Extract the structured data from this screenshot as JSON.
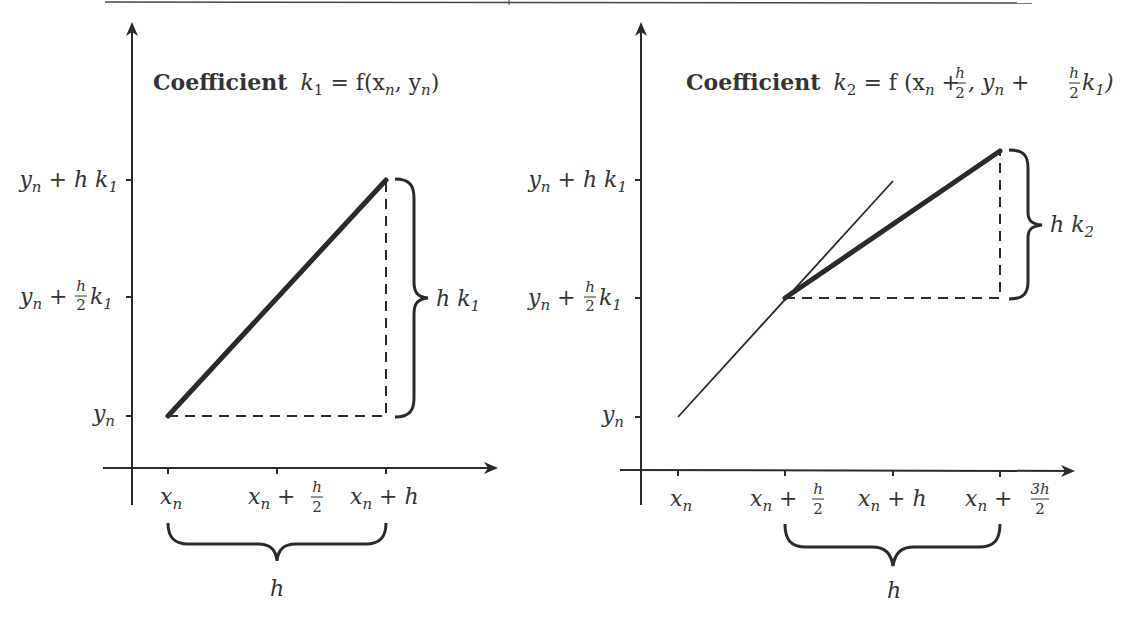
{
  "top_rule": {
    "visible": true
  },
  "panels": [
    {
      "id": "k1",
      "title": {
        "word": "Coefficient",
        "expr_var": "k",
        "expr_sub": "1",
        "expr_rhs": " = f(x",
        "rhs_sub1": "n",
        "rhs_mid": ", y",
        "rhs_sub2": "n",
        "rhs_end": ")"
      },
      "y_ticks": [
        {
          "text": "y",
          "sub": "n",
          "rest": " + h k",
          "rest_sub": "1",
          "pos": "top"
        },
        {
          "text": "y",
          "sub": "n",
          "rest_pre": " + ",
          "frac_num": "h",
          "frac_den": "2",
          "rest": " k",
          "rest_sub": "1",
          "pos": "mid"
        },
        {
          "text": "y",
          "sub": "n",
          "pos": "base"
        }
      ],
      "x_ticks": [
        {
          "text": "x",
          "sub": "n"
        },
        {
          "text": "x",
          "sub": "n",
          "rest_pre": " + ",
          "frac_num": "h",
          "frac_den": "2"
        },
        {
          "text": "x",
          "sub": "n",
          "rest": " + h"
        }
      ],
      "right_brace_label": {
        "text": "h k",
        "sub": "1"
      },
      "bottom_brace_label": "h"
    },
    {
      "id": "k2",
      "title": {
        "word": "Coefficient",
        "expr_var": "k",
        "expr_sub": "2",
        "expr_rhs": " = f (x",
        "rhs_sub1": "n",
        "rhs_plus1": " + ",
        "frac1_num": "h",
        "frac1_den": "2",
        "rhs_mid": ", y",
        "rhs_sub2": "n",
        "rhs_plus2": " + ",
        "frac2_num": "h",
        "frac2_den": "2",
        "rhs_k": " k",
        "rhs_ksub": "1",
        "rhs_end": ")"
      },
      "y_ticks": [
        {
          "text": "y",
          "sub": "n",
          "rest": " + h k",
          "rest_sub": "1",
          "pos": "top"
        },
        {
          "text": "y",
          "sub": "n",
          "rest_pre": " + ",
          "frac_num": "h",
          "frac_den": "2",
          "rest": " k",
          "rest_sub": "1",
          "pos": "mid"
        },
        {
          "text": "y",
          "sub": "n",
          "pos": "base"
        }
      ],
      "x_ticks": [
        {
          "text": "x",
          "sub": "n"
        },
        {
          "text": "x",
          "sub": "n",
          "rest_pre": " + ",
          "frac_num": "h",
          "frac_den": "2"
        },
        {
          "text": "x",
          "sub": "n",
          "rest": " + h"
        },
        {
          "text": "x",
          "sub": "n",
          "rest_pre": " + ",
          "frac_num": "3h",
          "frac_den": "2"
        }
      ],
      "right_brace_label": {
        "text": "h k",
        "sub": "2"
      },
      "bottom_brace_label": "h"
    }
  ],
  "colors": {
    "ink": "#2a2a2a",
    "background": "#ffffff"
  }
}
